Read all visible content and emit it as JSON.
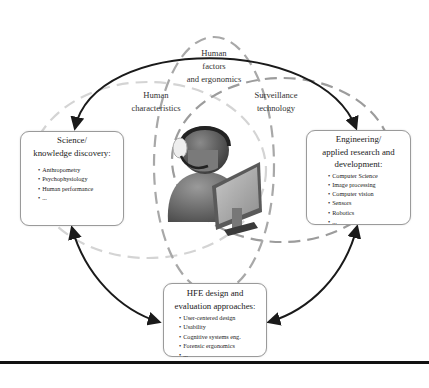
{
  "diagram": {
    "center_labels": {
      "hfe": [
        "Human",
        "factors",
        "and ergonomics"
      ],
      "human_characteristics": [
        "Human",
        "characteristics"
      ],
      "surveillance": [
        "Surveillance",
        "technology"
      ]
    },
    "boxes": {
      "science": {
        "title": [
          "Science/",
          "knowledge discovery:"
        ],
        "items": [
          "Anthropometry",
          "Psychophysiology",
          "Human performance",
          "..."
        ]
      },
      "engineering": {
        "title": [
          "Engineering/",
          "applied research and",
          "development:"
        ],
        "items": [
          "Computer Science",
          "Image processing",
          "Computer vision",
          "Sensors",
          "Robotics",
          "..."
        ]
      },
      "hfe_design": {
        "title": [
          "HFE design and",
          "evaluation approaches:"
        ],
        "items": [
          "User-centered design",
          "Usability",
          "Cognitive systems eng.",
          "Forensic ergonomics",
          "..."
        ]
      }
    },
    "center_icon": "operator-at-computer-icon",
    "colors": {
      "arrow": "#1a1a1a",
      "ellipse_hfe": "#a8a8a8",
      "ellipse_human": "#d4d4d4",
      "ellipse_surveillance": "#9c9c9c",
      "box_border": "#9a9a9a",
      "rule": "#111111"
    }
  }
}
